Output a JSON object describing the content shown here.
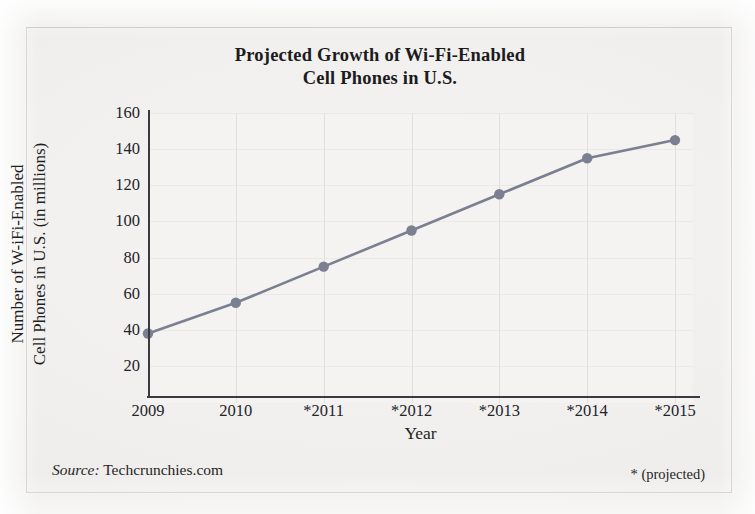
{
  "figure": {
    "background_color": "#f2f1ef",
    "frame_color": "#d8d7d3"
  },
  "footer": {
    "source_label": "Source:",
    "source_value": " Techcrunchies.com",
    "projected_note": "* (projected)"
  },
  "chart_data": {
    "type": "line",
    "title": "Projected Growth of Wi-Fi-Enabled Cell Phones in U.S.",
    "title_lines": [
      "Projected Growth of Wi-Fi-Enabled",
      "Cell Phones in U.S."
    ],
    "xlabel": "Year",
    "ylabel": "Number of Wi-Fi-Enabled Cell Phones in U.S. (in millions)",
    "ylabel_lines": [
      "Number of W-iFi-Enabled",
      "Cell Phones in U.S. (in millions)"
    ],
    "categories": [
      "2009",
      "2010",
      "*2011",
      "*2012",
      "*2013",
      "*2014",
      "*2015"
    ],
    "values": [
      38,
      55,
      75,
      95,
      115,
      135,
      145
    ],
    "ylim": [
      0,
      160
    ],
    "yticks": [
      160,
      140,
      120,
      100,
      80,
      60,
      40,
      20
    ],
    "ytick_labels": [
      "160",
      "140",
      "120",
      "100",
      "80",
      "60",
      "40",
      "20"
    ],
    "grid": "both-faint",
    "legend": "none",
    "series_color": "#7b7f92",
    "marker": "circle",
    "marker_color": "#7b7f92",
    "annotations": [
      "* (projected)"
    ]
  }
}
